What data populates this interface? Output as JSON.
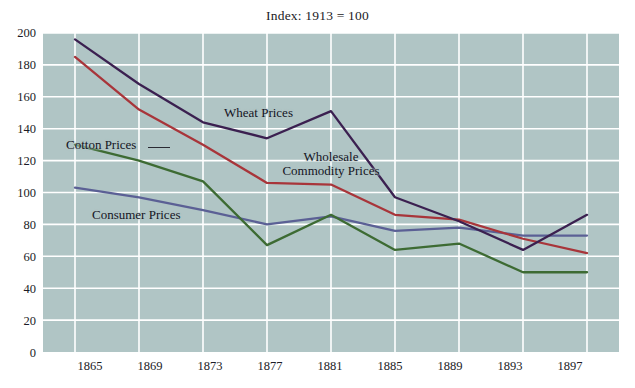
{
  "chart_data": {
    "type": "line",
    "title": "Index: 1913 = 100",
    "xlabel": "",
    "ylabel": "",
    "x": [
      1865,
      1869,
      1873,
      1877,
      1881,
      1885,
      1889,
      1893,
      1897
    ],
    "xlim": [
      1863,
      1899
    ],
    "ylim": [
      0,
      200
    ],
    "ytick_values": [
      0,
      20,
      40,
      60,
      80,
      100,
      120,
      140,
      160,
      180,
      200
    ],
    "xtick_values": [
      1865,
      1869,
      1873,
      1877,
      1881,
      1885,
      1889,
      1893,
      1897
    ],
    "grid": true,
    "legend_position": "inline-annotations",
    "plot_background": "#b0c5c5",
    "grid_color": "#ffffff",
    "series": [
      {
        "name": "Wheat Prices",
        "color": "#3b2050",
        "values": [
          196,
          168,
          144,
          134,
          151,
          97,
          82,
          64,
          86
        ]
      },
      {
        "name": "Wholesale Commodity Prices",
        "color": "#a8353a",
        "values": [
          185,
          152,
          130,
          106,
          105,
          86,
          83,
          71,
          62
        ]
      },
      {
        "name": "Cotton Prices",
        "color": "#3d6b33",
        "values": [
          130,
          120,
          107,
          67,
          86,
          64,
          68,
          50,
          50
        ]
      },
      {
        "name": "Consumer Prices",
        "color": "#5b6095",
        "values": [
          103,
          97,
          89,
          80,
          85,
          76,
          78,
          73,
          73
        ]
      }
    ],
    "annotations": [
      {
        "text": "Wheat Prices",
        "series": "Wheat Prices"
      },
      {
        "text": "Wholesale",
        "series": "Wholesale Commodity Prices"
      },
      {
        "text": "Commodity Prices",
        "series": "Wholesale Commodity Prices"
      },
      {
        "text": "Cotton Prices",
        "series": "Cotton Prices"
      },
      {
        "text": "Consumer Prices",
        "series": "Consumer Prices"
      }
    ]
  },
  "axis": {
    "y_labels": [
      "200",
      "180",
      "160",
      "140",
      "120",
      "100",
      "80",
      "60",
      "40",
      "20",
      "0"
    ],
    "x_labels": [
      "1865",
      "1869",
      "1873",
      "1877",
      "1881",
      "1885",
      "1889",
      "1893",
      "1897"
    ]
  },
  "labels": {
    "wheat": "Wheat Prices",
    "wholesale_line1": "Wholesale",
    "wholesale_line2": "Commodity Prices",
    "cotton": "Cotton Prices",
    "consumer": "Consumer Prices"
  }
}
